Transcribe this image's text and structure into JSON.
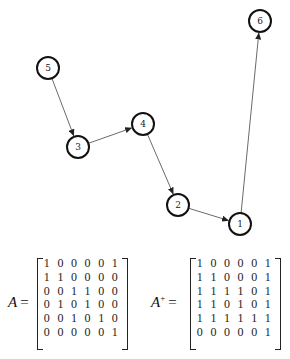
{
  "graph": {
    "nodes": [
      {
        "id": "1",
        "label": "1",
        "x": 240,
        "y": 224
      },
      {
        "id": "2",
        "label": "2",
        "x": 178,
        "y": 205
      },
      {
        "id": "3",
        "label": "3",
        "x": 78,
        "y": 147
      },
      {
        "id": "4",
        "label": "4",
        "x": 143,
        "y": 124
      },
      {
        "id": "5",
        "label": "5",
        "x": 48,
        "y": 68
      },
      {
        "id": "6",
        "label": "6",
        "x": 260,
        "y": 21
      }
    ],
    "edges": [
      {
        "from": "5",
        "to": "3"
      },
      {
        "from": "3",
        "to": "4"
      },
      {
        "from": "4",
        "to": "2"
      },
      {
        "from": "2",
        "to": "1"
      },
      {
        "from": "1",
        "to": "6"
      }
    ],
    "node_radius": 11
  },
  "matrices": [
    {
      "name": "A",
      "label_main": "A",
      "label_sup": "",
      "equals": "=",
      "rows": [
        [
          "1",
          "0",
          "0",
          "0",
          "0",
          "1"
        ],
        [
          "1",
          "1",
          "0",
          "0",
          "0",
          "0"
        ],
        [
          "0",
          "0",
          "1",
          "1",
          "0",
          "0"
        ],
        [
          "0",
          "1",
          "0",
          "1",
          "0",
          "0"
        ],
        [
          "0",
          "0",
          "1",
          "0",
          "1",
          "0"
        ],
        [
          "0",
          "0",
          "0",
          "0",
          "0",
          "1"
        ]
      ]
    },
    {
      "name": "A+",
      "label_main": "A",
      "label_sup": "+",
      "equals": "=",
      "rows": [
        [
          "1",
          "0",
          "0",
          "0",
          "0",
          "1"
        ],
        [
          "1",
          "1",
          "0",
          "0",
          "0",
          "1"
        ],
        [
          "1",
          "1",
          "1",
          "1",
          "0",
          "1"
        ],
        [
          "1",
          "1",
          "0",
          "1",
          "0",
          "1"
        ],
        [
          "1",
          "1",
          "1",
          "1",
          "1",
          "1"
        ],
        [
          "0",
          "0",
          "0",
          "0",
          "0",
          "1"
        ]
      ]
    }
  ]
}
